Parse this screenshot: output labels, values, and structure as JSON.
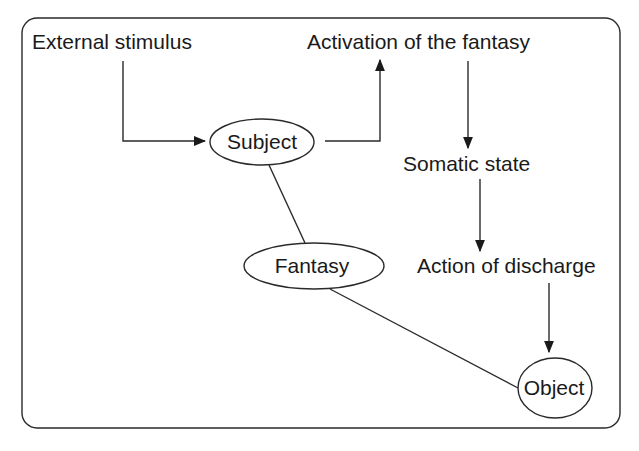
{
  "diagram": {
    "labels": {
      "external_stimulus": "External stimulus",
      "activation": "Activation of the fantasy",
      "somatic_state": "Somatic state",
      "action_of_discharge": "Action of discharge"
    },
    "nodes": {
      "subject": "Subject",
      "fantasy": "Fantasy",
      "object": "Object"
    },
    "edges": [
      {
        "from": "External stimulus",
        "to": "Subject",
        "type": "arrow"
      },
      {
        "from": "Subject",
        "to": "Activation of the fantasy",
        "type": "arrow"
      },
      {
        "from": "Activation of the fantasy",
        "to": "Somatic state",
        "type": "arrow"
      },
      {
        "from": "Somatic state",
        "to": "Action of discharge",
        "type": "arrow"
      },
      {
        "from": "Action of discharge",
        "to": "Object",
        "type": "arrow"
      },
      {
        "from": "Subject",
        "to": "Fantasy",
        "type": "line"
      },
      {
        "from": "Fantasy",
        "to": "Object",
        "type": "line"
      }
    ],
    "colors": {
      "stroke": "#2a2a2a",
      "text": "#1a1a1a",
      "background": "#ffffff"
    }
  }
}
